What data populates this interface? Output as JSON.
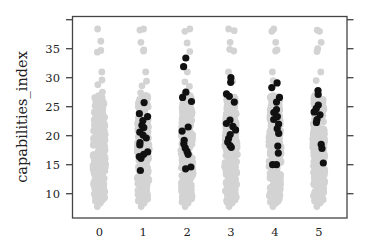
{
  "chart_data": {
    "type": "scatter",
    "subtype": "strip",
    "title": "",
    "xlabel": "",
    "ylabel": "capabilities_index",
    "categories": [
      "0",
      "1",
      "2",
      "3",
      "4",
      "5"
    ],
    "yticks": [
      10,
      15,
      20,
      25,
      30,
      35,
      40
    ],
    "ytick_labels": [
      "10",
      "15",
      "20",
      "25",
      "30",
      "35",
      ""
    ],
    "ylim": [
      7,
      41.3
    ],
    "grid": false,
    "legend": null,
    "colors": {
      "background_points": "#d3d3d3",
      "highlight_points": "#111111",
      "axis": "#444444"
    },
    "series": [
      {
        "name": "all",
        "color": "#d3d3d3",
        "ranges": [
          {
            "category": "0",
            "min": 7.8,
            "max": 38.5,
            "dense_min": 8.5,
            "dense_max": 27
          },
          {
            "category": "1",
            "min": 7.8,
            "max": 38.5,
            "dense_min": 8.5,
            "dense_max": 27
          },
          {
            "category": "2",
            "min": 7.8,
            "max": 38.5,
            "dense_min": 8.5,
            "dense_max": 27
          },
          {
            "category": "3",
            "min": 7.8,
            "max": 38.5,
            "dense_min": 8.5,
            "dense_max": 27
          },
          {
            "category": "4",
            "min": 7.8,
            "max": 38.5,
            "dense_min": 8.5,
            "dense_max": 27
          },
          {
            "category": "5",
            "min": 7.8,
            "max": 38.5,
            "dense_min": 8.5,
            "dense_max": 27
          }
        ],
        "outliers": [
          {
            "category": "0",
            "values": [
              38.4,
              36.3,
              34.7,
              34.4,
              31.0,
              29.6,
              28.8,
              27.5
            ]
          },
          {
            "category": "1",
            "values": [
              38.4,
              38.2,
              36.1,
              34.6,
              34.8,
              31.0,
              29.4,
              28.6,
              27.4
            ]
          },
          {
            "category": "2",
            "values": [
              38.4,
              38.0,
              36.0,
              34.5,
              31.0,
              29.3,
              28.5
            ]
          },
          {
            "category": "3",
            "values": [
              38.4,
              38.1,
              36.1,
              34.6,
              34.9,
              31.0,
              29.4
            ]
          },
          {
            "category": "4",
            "values": [
              38.4,
              38.0,
              36.1,
              34.6,
              34.8,
              31.0,
              29.5
            ]
          },
          {
            "category": "5",
            "values": [
              38.2,
              38.0,
              36.1,
              35.0,
              34.5,
              31.0,
              29.5
            ]
          }
        ]
      },
      {
        "name": "highlighted",
        "color": "#111111",
        "points": [
          {
            "category": "1",
            "values": [
              25.7,
              23.8,
              23.3,
              22.6,
              21.8,
              21.4,
              20.6,
              20.1,
              19.6,
              18.8,
              18.4,
              17.2,
              16.8,
              16.4,
              16.1,
              14.0
            ]
          },
          {
            "category": "2",
            "values": [
              33.4,
              31.9,
              27.5,
              26.6,
              25.9,
              21.5,
              20.8,
              19.2,
              18.6,
              17.9,
              17.3,
              16.8,
              14.6,
              14.3
            ]
          },
          {
            "category": "3",
            "values": [
              30.0,
              29.2,
              27.2,
              26.8,
              25.8,
              22.7,
              22.1,
              21.6,
              21.0,
              20.2,
              19.5,
              18.9,
              18.3,
              18.0
            ]
          },
          {
            "category": "4",
            "values": [
              29.1,
              28.3,
              26.6,
              25.8,
              24.5,
              24.0,
              23.3,
              22.8,
              22.0,
              21.2,
              20.4,
              18.2,
              17.0,
              15.0,
              15.0
            ]
          },
          {
            "category": "5",
            "values": [
              27.8,
              27.1,
              25.3,
              24.7,
              24.1,
              23.6,
              22.8,
              22.3,
              18.5,
              17.8,
              15.3
            ]
          }
        ]
      }
    ]
  },
  "axes": {
    "ylabel": "capabilities_index",
    "x_tick_labels": [
      "0",
      "1",
      "2",
      "3",
      "4",
      "5"
    ],
    "y_tick_labels": [
      "10",
      "15",
      "20",
      "25",
      "30",
      "35"
    ]
  }
}
